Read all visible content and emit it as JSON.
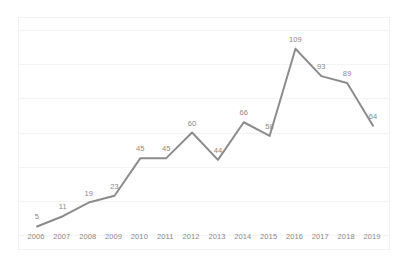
{
  "chart_data": {
    "type": "line",
    "title": "",
    "subtitle": "",
    "xlabel": "",
    "ylabel": "",
    "categories": [
      "2006",
      "2007",
      "2008",
      "2009",
      "2010",
      "2011",
      "2012",
      "2013",
      "2014",
      "2015",
      "2016",
      "2017",
      "2018",
      "2019"
    ],
    "values": [
      5,
      11,
      19,
      23,
      45,
      45,
      60,
      44,
      66,
      58,
      109,
      93,
      89,
      64
    ],
    "series": [
      {
        "name": "",
        "values": [
          5,
          11,
          19,
          23,
          45,
          45,
          60,
          44,
          66,
          58,
          109,
          93,
          89,
          64
        ]
      }
    ],
    "data_labels": [
      "5",
      "11",
      "19",
      "23",
      "45",
      "45",
      "60",
      "44",
      "66",
      "58",
      "109",
      "93",
      "89",
      "64"
    ],
    "tick_labels": [
      "2006",
      "2007",
      "2008",
      "2009",
      "2010",
      "2011",
      "2012",
      "2013",
      "2014",
      "2015",
      "2016",
      "2017",
      "2018",
      "2019"
    ],
    "ylim": [
      0,
      120
    ],
    "xlim_categories": 14,
    "grid": true,
    "grid_horizontal": true,
    "grid_vertical": false,
    "gridline_count": 7,
    "legend": false,
    "legend_position": "none",
    "value_axis_visible": false,
    "markers": false,
    "colors": {
      "line": "#8c8c8c",
      "label_text": "#8a8a8a",
      "tick_text": "#8a8a8a",
      "gridline": "#f4f4f4",
      "plot_border": "#f2f2f2",
      "background": "#ffffff"
    },
    "line_width": 2
  }
}
